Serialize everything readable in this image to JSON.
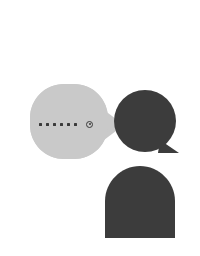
{
  "canvas": {
    "width": 200,
    "height": 256,
    "background": "#ffffff",
    "title": "Abstract speech bubble shapes"
  },
  "palette": {
    "light_bubble": "#c9c9c9",
    "dark_shape": "#3c3c3c",
    "dot": "#3a3a3a",
    "background": "#ffffff"
  },
  "shapes": [
    {
      "id": "light-speech-bubble",
      "name": "light-speech-bubble",
      "type": "rounded-speech-bubble",
      "fill": "#c9c9c9",
      "x": 30,
      "y": 84,
      "width": 78,
      "height": 75,
      "corner_radius": 34,
      "tail": {
        "direction": "right",
        "tip_x": 122,
        "tip_y": 125
      }
    },
    {
      "id": "dark-round-bubble",
      "name": "dark-round-speech-bubble",
      "type": "circle-speech-bubble",
      "fill": "#3c3c3c",
      "cx": 145,
      "cy": 121,
      "r": 31,
      "tail": {
        "direction": "bottom-right",
        "tip_x": 178,
        "tip_y": 152
      }
    },
    {
      "id": "dark-arch",
      "name": "dark-arch-shape",
      "type": "arch",
      "fill": "#3c3c3c",
      "x": 105,
      "y": 166,
      "width": 70,
      "height": 72,
      "top_radius": 35
    }
  ],
  "bubble_content": {
    "label": "typing-indicator",
    "dots": [
      {
        "label": "dot-1",
        "color": "#3a3a3a"
      },
      {
        "label": "dot-2",
        "color": "#3a3a3a"
      },
      {
        "label": "dot-3",
        "color": "#3a3a3a"
      },
      {
        "label": "dot-4",
        "color": "#3a3a3a"
      },
      {
        "label": "dot-5",
        "color": "#3a3a3a"
      },
      {
        "label": "dot-6",
        "color": "#3a3a3a"
      }
    ],
    "icon": {
      "name": "target-ring-icon",
      "color": "#3a3a3a"
    },
    "dots_x": 39,
    "dots_y": 122
  }
}
